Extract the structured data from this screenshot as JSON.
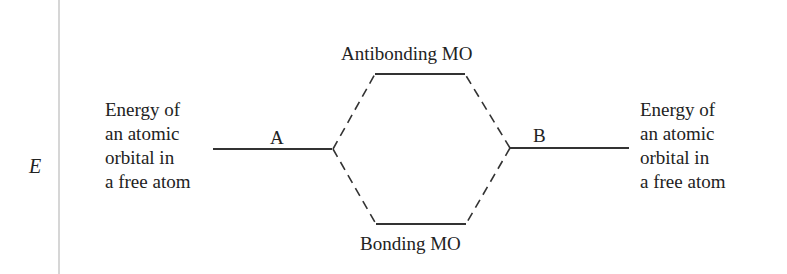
{
  "axis": {
    "label": "E"
  },
  "left_atom": {
    "description": "Energy of\nan atomic\norbital in\na free atom",
    "label": "A"
  },
  "right_atom": {
    "description": "Energy of\nan atomic\norbital in\na free atom",
    "label": "B"
  },
  "molecular_orbitals": {
    "antibonding": "Antibonding MO",
    "bonding": "Bonding MO"
  },
  "colors": {
    "line": "#333333",
    "axis": "#d6d6d6"
  }
}
